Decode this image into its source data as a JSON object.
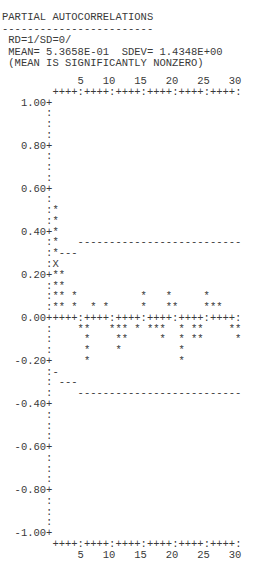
{
  "header": {
    "title": "PARTIAL AUTOCORRELATIONS",
    "underline": "------------------------",
    "parameters": "RD=1/SD=0/",
    "statistics": "MEAN= 5.3658E-01  SDEV= 1.4348E+00",
    "note": "(MEAN IS SIGNIFICANTLY NONZERO)"
  },
  "plot": {
    "x_tick_labels": [
      "5",
      "10",
      "15",
      "20",
      "25",
      "30"
    ],
    "x_axis": "++++:++++:++++:++++:++++:++++:",
    "rows": [
      {
        "y": "1.00",
        "axis": "+",
        "marks": ""
      },
      {
        "y": "",
        "axis": ":",
        "marks": ""
      },
      {
        "y": "",
        "axis": ":",
        "marks": ""
      },
      {
        "y": "",
        "axis": ":",
        "marks": ""
      },
      {
        "y": "0.80",
        "axis": "+",
        "marks": ""
      },
      {
        "y": "",
        "axis": ":",
        "marks": ""
      },
      {
        "y": "",
        "axis": ":",
        "marks": ""
      },
      {
        "y": "",
        "axis": ":",
        "marks": ""
      },
      {
        "y": "0.60",
        "axis": "+",
        "marks": ""
      },
      {
        "y": "",
        "axis": ":",
        "marks": ""
      },
      {
        "y": "",
        "axis": ":",
        "marks": "*"
      },
      {
        "y": "",
        "axis": ":",
        "marks": "*"
      },
      {
        "y": "0.40",
        "axis": "+",
        "marks": "*"
      },
      {
        "y": "",
        "axis": ":",
        "marks": "*   --------------------------"
      },
      {
        "y": "",
        "axis": ":",
        "marks": "*---"
      },
      {
        "y": "",
        "axis": ":",
        "marks": "X"
      },
      {
        "y": "0.20",
        "axis": "+",
        "marks": "**"
      },
      {
        "y": "",
        "axis": ":",
        "marks": "**"
      },
      {
        "y": "",
        "axis": ":",
        "marks": "** *          *   *     *"
      },
      {
        "y": "",
        "axis": ":",
        "marks": "** *  * *     *   **    ***"
      },
      {
        "y": "0.00",
        "axis": "+",
        "marks": "++++:++++:++++:++++:++++:++++:"
      },
      {
        "y": "",
        "axis": ":",
        "marks": "    **   *** * ***  * **    **"
      },
      {
        "y": "",
        "axis": ":",
        "marks": "     *    **     *  * **     *"
      },
      {
        "y": "",
        "axis": ":",
        "marks": "     *    *         *"
      },
      {
        "y": "-0.20",
        "axis": "+",
        "marks": "     *              *"
      },
      {
        "y": "",
        "axis": ":",
        "marks": "-"
      },
      {
        "y": "",
        "axis": ":",
        "marks": " ---"
      },
      {
        "y": "",
        "axis": ":",
        "marks": "    --------------------------"
      },
      {
        "y": "-0.40",
        "axis": "+",
        "marks": ""
      },
      {
        "y": "",
        "axis": ":",
        "marks": ""
      },
      {
        "y": "",
        "axis": ":",
        "marks": ""
      },
      {
        "y": "",
        "axis": ":",
        "marks": ""
      },
      {
        "y": "-0.60",
        "axis": "+",
        "marks": ""
      },
      {
        "y": "",
        "axis": ":",
        "marks": ""
      },
      {
        "y": "",
        "axis": ":",
        "marks": ""
      },
      {
        "y": "",
        "axis": ":",
        "marks": ""
      },
      {
        "y": "-0.80",
        "axis": "+",
        "marks": ""
      },
      {
        "y": "",
        "axis": ":",
        "marks": ""
      },
      {
        "y": "",
        "axis": ":",
        "marks": ""
      },
      {
        "y": "",
        "axis": ":",
        "marks": ""
      },
      {
        "y": "-1.00",
        "axis": "+",
        "marks": ""
      }
    ]
  },
  "chart_data": {
    "type": "bar",
    "title": "PARTIAL AUTOCORRELATIONS",
    "subtitle": "RD=1/SD=0/  MEAN= 5.3658E-01  SDEV= 1.4348E+00  (MEAN IS SIGNIFICANTLY NONZERO)",
    "xlabel": "",
    "ylabel": "",
    "categories": [
      1,
      2,
      3,
      4,
      5,
      6,
      7,
      8,
      9,
      10,
      11,
      12,
      13,
      14,
      15,
      16,
      17,
      18,
      19,
      20,
      21,
      22,
      23,
      24,
      25,
      26,
      27,
      28,
      29,
      30
    ],
    "values": [
      0.5,
      0.2,
      0.0,
      0.1,
      -0.05,
      -0.2,
      0.05,
      0.0,
      0.05,
      -0.05,
      -0.15,
      -0.1,
      0.0,
      -0.05,
      0.1,
      -0.05,
      -0.05,
      -0.1,
      0.1,
      0.05,
      -0.2,
      0.0,
      -0.1,
      -0.1,
      0.1,
      0.05,
      0.05,
      0.0,
      -0.05,
      -0.1
    ],
    "confidence_limits": {
      "upper": [
        0.25,
        0.3,
        0.3,
        0.3,
        0.35,
        0.35,
        0.35,
        0.35,
        0.35,
        0.35,
        0.35,
        0.35,
        0.35,
        0.35,
        0.35,
        0.35,
        0.35,
        0.35,
        0.35,
        0.35,
        0.35,
        0.35,
        0.35,
        0.35,
        0.35,
        0.35,
        0.35,
        0.35,
        0.35,
        0.35
      ],
      "lower": [
        -0.25,
        -0.3,
        -0.3,
        -0.3,
        -0.35,
        -0.35,
        -0.35,
        -0.35,
        -0.35,
        -0.35,
        -0.35,
        -0.35,
        -0.35,
        -0.35,
        -0.35,
        -0.35,
        -0.35,
        -0.35,
        -0.35,
        -0.35,
        -0.35,
        -0.35,
        -0.35,
        -0.35,
        -0.35,
        -0.35,
        -0.35,
        -0.35,
        -0.35,
        -0.35
      ]
    },
    "xticks": [
      5,
      10,
      15,
      20,
      25,
      30
    ],
    "yticks": [
      "1.00",
      "0.80",
      "0.60",
      "0.40",
      "0.20",
      "0.00",
      "-0.20",
      "-0.40",
      "-0.60",
      "-0.80",
      "-1.00"
    ],
    "xlim": [
      1,
      30
    ],
    "ylim": [
      -1.0,
      1.0
    ],
    "grid": false,
    "legend": null,
    "markers": {
      "bar": "*",
      "overlap_with_limit": "X",
      "confidence_limit": "-"
    }
  }
}
